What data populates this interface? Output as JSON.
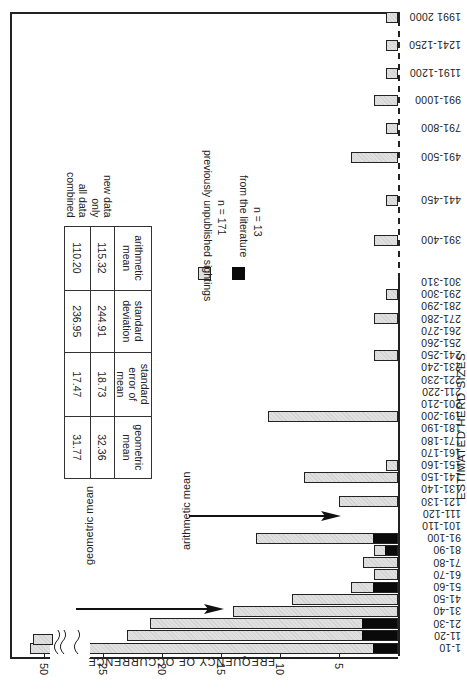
{
  "chart_data": {
    "type": "bar",
    "orientation": "rotated-90",
    "title": "",
    "xlabel": "ESTIMATED HERD SIZES",
    "ylabel": "FREQUENCY OF OCCURRENCE",
    "ylim": [
      0,
      27
    ],
    "y_break": {
      "after": 27,
      "resume_label": "50"
    },
    "y_ticks": [
      "5",
      "10",
      "15",
      "20",
      "25",
      "50"
    ],
    "categories": [
      "1-10",
      "11-20",
      "21-30",
      "31-40",
      "41-50",
      "51-60",
      "61-70",
      "71-80",
      "81-90",
      "91-100",
      "101-110",
      "111-120",
      "121-130",
      "131-140",
      "141-150",
      "151-160",
      "161-170",
      "171-180",
      "181-190",
      "191-200",
      "201-210",
      "211-220",
      "221-230",
      "231-240",
      "241-250",
      "251-260",
      "261-270",
      "271-280",
      "281-290",
      "291-300",
      "301-310",
      "391-400",
      "441-450",
      "491-500",
      "791-800",
      "991-1000",
      "1191-1200",
      "1241-1250",
      "1991 2000"
    ],
    "series": [
      {
        "name": "previously unpublished sightings",
        "n_label": "n = 171",
        "values": [
          50,
          20,
          18,
          14,
          9,
          2,
          2,
          3,
          1,
          10,
          0,
          0,
          5,
          0,
          8,
          1,
          0,
          0,
          0,
          11,
          0,
          0,
          0,
          0,
          2,
          0,
          0,
          2,
          0,
          1,
          0,
          2,
          1,
          4,
          1,
          2,
          1,
          1,
          1
        ]
      },
      {
        "name": "from the literature",
        "n_label": "n = 13",
        "values": [
          2,
          3,
          3,
          0,
          0,
          2,
          0,
          0,
          1,
          2,
          0,
          0,
          0,
          0,
          0,
          0,
          0,
          0,
          0,
          0,
          0,
          0,
          0,
          0,
          0,
          0,
          0,
          0,
          0,
          0,
          0,
          0,
          0,
          0,
          0,
          0,
          0,
          0,
          0
        ]
      }
    ],
    "totals": [
      52,
      23,
      21,
      14,
      9,
      4,
      2,
      3,
      2,
      12,
      0,
      0,
      5,
      0,
      8,
      1,
      0,
      0,
      0,
      11,
      0,
      0,
      0,
      0,
      2,
      0,
      0,
      2,
      0,
      1,
      0,
      2,
      1,
      4,
      1,
      2,
      1,
      1,
      1
    ],
    "annotations": [
      {
        "text": "geometric mean",
        "points_to": "31-40"
      },
      {
        "text": "arithmetic mean",
        "points_to": "111-120"
      }
    ],
    "legend": {
      "position": "upper-middle"
    },
    "grid": false
  },
  "legend": {
    "items": [
      {
        "label": "previously unpublished sightings",
        "n": "n = 171",
        "color": "#e0e0e0"
      },
      {
        "label": "from the literature",
        "n": "n = 13",
        "color": "#0a0a0a"
      }
    ]
  },
  "annotations": {
    "geometric": "geometric mean",
    "arithmetic": "arithmetic mean"
  },
  "axes": {
    "x_label": "ESTIMATED HERD SIZES",
    "y_label": "FREQUENCY OF OCCURRENCE"
  },
  "stats_table": {
    "headers": [
      "arithmetic mean",
      "standard deviation",
      "standard error of mean",
      "geometric mean"
    ],
    "header_lines": [
      [
        "arithmetic",
        "mean"
      ],
      [
        "standard",
        "deviation"
      ],
      [
        "standard",
        "error of mean"
      ],
      [
        "geometric",
        "mean"
      ]
    ],
    "rows": [
      {
        "label": "new data only",
        "values": [
          "115.32",
          "244.91",
          "18.73",
          "32.36"
        ]
      },
      {
        "label": "all data combined",
        "values": [
          "110.20",
          "236.95",
          "17.47",
          "31.77"
        ]
      }
    ]
  }
}
